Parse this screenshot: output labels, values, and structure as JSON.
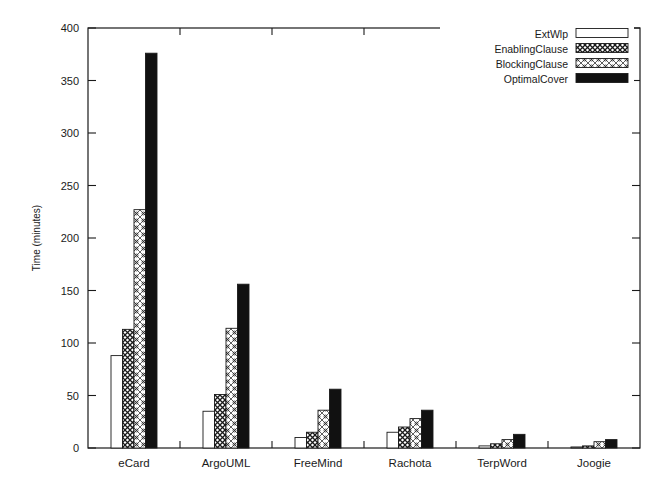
{
  "chart_data": {
    "type": "bar",
    "title": "",
    "xlabel": "",
    "ylabel": "Time (minutes)",
    "ylim": [
      0,
      400
    ],
    "ytick_step": 50,
    "yticks": [
      "0",
      "50",
      "100",
      "150",
      "200",
      "250",
      "300",
      "350",
      "400"
    ],
    "grid": false,
    "legend_position": "top-right",
    "categories": [
      "eCard",
      "ArgoUML",
      "FreeMind",
      "Rachota",
      "TerpWord",
      "Joogie"
    ],
    "series": [
      {
        "name": "ExtWlp",
        "fill": "empty",
        "values": [
          88,
          35,
          10,
          15,
          2,
          1
        ]
      },
      {
        "name": "EnablingClause",
        "fill": "dense-crosshatch",
        "values": [
          113,
          51,
          15,
          20,
          4,
          2
        ]
      },
      {
        "name": "BlockingClause",
        "fill": "light-pattern",
        "values": [
          227,
          114,
          36,
          28,
          8,
          6
        ]
      },
      {
        "name": "OptimalCover",
        "fill": "solid-black",
        "values": [
          376,
          156,
          56,
          36,
          13,
          8
        ]
      }
    ]
  },
  "colors": {
    "axis": "#1a1a1a",
    "bar_outline": "#1a1a1a",
    "solid_fill": "#111111",
    "background": "#ffffff"
  }
}
